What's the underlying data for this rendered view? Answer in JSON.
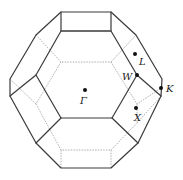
{
  "figure": {
    "points": [
      {
        "name": "Gamma",
        "label": "Γ",
        "x": 85,
        "y": 90,
        "lx": 80,
        "ly": 104
      },
      {
        "name": "L",
        "label": "L",
        "x": 135,
        "y": 54,
        "lx": 139,
        "ly": 65
      },
      {
        "name": "W",
        "label": "W",
        "x": 137,
        "y": 75,
        "lx": 122,
        "ly": 80
      },
      {
        "name": "K",
        "label": "K",
        "x": 161,
        "y": 88,
        "lx": 166,
        "ly": 92
      },
      {
        "name": "X",
        "label": "X",
        "x": 136,
        "y": 108,
        "lx": 134,
        "ly": 121
      }
    ],
    "colors": {
      "edge": "#3a3a3a",
      "hidden_edge": "#9a9a9a",
      "point": "#111111"
    }
  }
}
